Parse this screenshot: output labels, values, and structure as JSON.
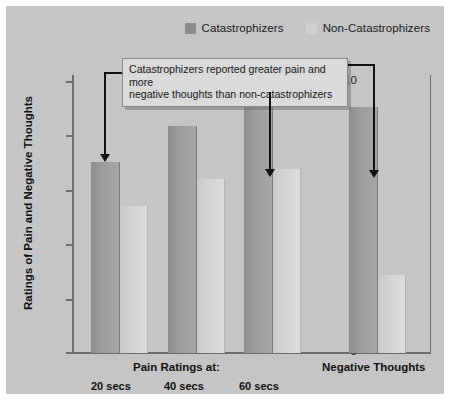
{
  "figure": {
    "background_color": "#c5c5c5",
    "border_color": "#ffffff"
  },
  "legend": {
    "position": "top-right",
    "items": [
      {
        "label": "Catastrophizers",
        "color": "#8d8d8d",
        "swatch_name": "legend-swatch-catastrophizers"
      },
      {
        "label": "Non-Catastrophizers",
        "color": "#cfcfcf",
        "swatch_name": "legend-swatch-non-catastrophizers"
      }
    ]
  },
  "callout": {
    "text": "Catastrophizers reported greater pain and more negative thoughts than non-catastrophizers",
    "line1": "Catastrophizers reported greater pain and more",
    "line2": "negative thoughts than non-catastrophizers",
    "background": "#dadada",
    "border": "#8a8a8a"
  },
  "axes": {
    "y_title": "Ratings of Pain and Negative Thoughts",
    "y_ticks": [
      "10",
      "8",
      "6",
      "4",
      "2",
      "0"
    ],
    "x_group_titles": [
      {
        "label": "Pain Ratings at:"
      },
      {
        "label": "Negative Thoughts"
      }
    ],
    "x_tick_labels": [
      "20 secs",
      "40 secs",
      "60 secs"
    ]
  },
  "chart_data": {
    "type": "bar",
    "title": "",
    "subtitle": "",
    "annotations": [
      "Catastrophizers reported greater pain and more negative thoughts than non-catastrophizers"
    ],
    "xlabel": "",
    "ylabel": "Ratings of Pain and Negative Thoughts",
    "ylim": [
      0,
      10
    ],
    "yticks": [
      0,
      2,
      4,
      6,
      8,
      10
    ],
    "grid": false,
    "legend_position": "top-right",
    "categories": [
      "20 secs",
      "40 secs",
      "60 secs",
      "Negative Thoughts"
    ],
    "category_groups": [
      "Pain Ratings at:",
      "Pain Ratings at:",
      "Pain Ratings at:",
      "Negative Thoughts"
    ],
    "series": [
      {
        "name": "Catastrophizers",
        "color": "#9a9a9a",
        "values": [
          6.9,
          8.2,
          8.9,
          8.9
        ]
      },
      {
        "name": "Non-Catastrophizers",
        "color": "#d2d2d2",
        "values": [
          5.3,
          6.3,
          6.65,
          2.8
        ]
      }
    ]
  }
}
